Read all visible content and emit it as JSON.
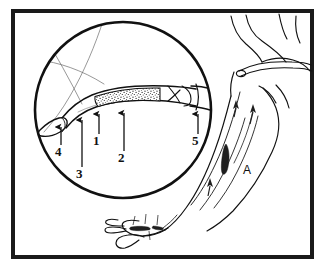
{
  "figure": {
    "kind": "anatomical-line-drawing",
    "background_color": "#ffffff",
    "ink_color": "#111111",
    "frame": {
      "border_color": "#1a1a1a",
      "border_width_px": 4,
      "fill": "#ffffff"
    },
    "inset": {
      "name": "magnifier-circle",
      "shape": "circle",
      "center_x": 123,
      "center_y": 110,
      "radius": 89,
      "stroke_color": "#111111",
      "stroke_width_px": 2.6,
      "fill": "#ffffff"
    },
    "thrombus": {
      "name": "thrombus-stipple",
      "pattern": "stippled",
      "dot_color": "#1b1b1b",
      "fill": "#ffffff"
    }
  },
  "labels": [
    {
      "id": "1",
      "text": "1",
      "x": 96,
      "y": 141,
      "arrow_from_x": 99,
      "arrow_from_y": 134,
      "arrow_to_x": 99,
      "arrow_to_y": 114
    },
    {
      "id": "2",
      "text": "2",
      "x": 121,
      "y": 158,
      "arrow_from_x": 124,
      "arrow_from_y": 151,
      "arrow_to_x": 124,
      "arrow_to_y": 113
    },
    {
      "id": "3",
      "text": "3",
      "x": 79,
      "y": 174,
      "arrow_from_x": 82,
      "arrow_from_y": 167,
      "arrow_to_x": 82,
      "arrow_to_y": 120
    },
    {
      "id": "4",
      "text": "4",
      "x": 58,
      "y": 152,
      "arrow_from_x": 61,
      "arrow_from_y": 145,
      "arrow_to_x": 61,
      "arrow_to_y": 127
    },
    {
      "id": "5",
      "text": "5",
      "x": 195,
      "y": 141,
      "arrow_from_x": 198,
      "arrow_from_y": 134,
      "arrow_to_x": 198,
      "arrow_to_y": 114
    },
    {
      "id": "A",
      "text": "A",
      "x": 246,
      "y": 172,
      "arrow_from_x": null,
      "arrow_from_y": null,
      "arrow_to_x": null,
      "arrow_to_y": null
    }
  ],
  "flow_arrows": [
    {
      "name": "flow-arrow-upper",
      "x": 236,
      "y": 108,
      "angle_deg": -20
    },
    {
      "name": "flow-arrow-mid",
      "x": 252,
      "y": 118,
      "angle_deg": -20
    },
    {
      "name": "flow-arrow-lower",
      "x": 210,
      "y": 186,
      "angle_deg": -20
    }
  ]
}
